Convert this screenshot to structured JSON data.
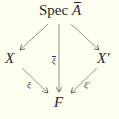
{
  "diagram": {
    "type": "commutative-diagram",
    "nodes": {
      "top": {
        "prefix": "Spec",
        "symbol": "A",
        "overline": true
      },
      "left": {
        "symbol": "X"
      },
      "right": {
        "symbol": "X′"
      },
      "bottom": {
        "symbol": "F"
      }
    },
    "arrows": [
      {
        "from": "top",
        "to": "left",
        "label": ""
      },
      {
        "from": "top",
        "to": "right",
        "label": ""
      },
      {
        "from": "top",
        "to": "bottom",
        "label": "ξ",
        "label_overline": true
      },
      {
        "from": "left",
        "to": "bottom",
        "label": "ξ"
      },
      {
        "from": "right",
        "to": "bottom",
        "label": "ξ′"
      }
    ]
  }
}
